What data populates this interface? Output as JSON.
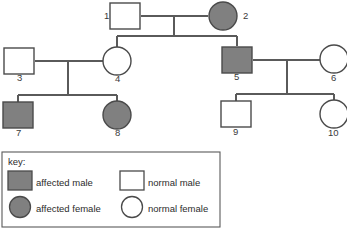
{
  "diagram": {
    "type": "pedigree-chart",
    "colors": {
      "affected_fill": "#808080",
      "normal_fill": "#ffffff",
      "stroke": "#4a4a4a",
      "line": "#5a5a5a",
      "background": "#ffffff"
    },
    "individuals": [
      {
        "id": "1",
        "label": "1",
        "sex": "male",
        "status": "normal",
        "shape": "square",
        "x": 125,
        "y": 16,
        "label_x": 104,
        "label_y": 19,
        "generation": 1
      },
      {
        "id": "2",
        "label": "2",
        "sex": "female",
        "status": "affected",
        "shape": "circle",
        "x": 223,
        "y": 16,
        "label_x": 243,
        "label_y": 19,
        "generation": 1
      },
      {
        "id": "3",
        "label": "3",
        "sex": "male",
        "status": "normal",
        "shape": "square",
        "x": 19,
        "y": 61,
        "label_x": 17,
        "label_y": 81,
        "generation": 2
      },
      {
        "id": "4",
        "label": "4",
        "sex": "female",
        "status": "normal",
        "shape": "circle",
        "x": 117,
        "y": 61,
        "label_x": 115,
        "label_y": 82,
        "generation": 2
      },
      {
        "id": "5",
        "label": "5",
        "sex": "male",
        "status": "affected",
        "shape": "square",
        "x": 237,
        "y": 60,
        "label_x": 234,
        "label_y": 80,
        "generation": 2
      },
      {
        "id": "6",
        "label": "6",
        "sex": "female",
        "status": "normal",
        "shape": "circle",
        "x": 334,
        "y": 59,
        "label_x": 331,
        "label_y": 81,
        "generation": 2
      },
      {
        "id": "7",
        "label": "7",
        "sex": "male",
        "status": "affected",
        "shape": "square",
        "x": 18,
        "y": 115,
        "label_x": 16,
        "label_y": 136,
        "generation": 3
      },
      {
        "id": "8",
        "label": "8",
        "sex": "female",
        "status": "affected",
        "shape": "circle",
        "x": 117,
        "y": 115,
        "label_x": 115,
        "label_y": 136,
        "generation": 3
      },
      {
        "id": "9",
        "label": "9",
        "sex": "male",
        "status": "normal",
        "shape": "square",
        "x": 236,
        "y": 114,
        "label_x": 233,
        "label_y": 135,
        "generation": 3
      },
      {
        "id": "10",
        "label": "10",
        "sex": "female",
        "status": "normal",
        "shape": "circle",
        "x": 334,
        "y": 114,
        "label_x": 328,
        "label_y": 136,
        "generation": 3
      }
    ],
    "matings": [
      {
        "name": "mating-1-2",
        "partners": [
          "1",
          "2"
        ],
        "line_y": 16,
        "x1": 141,
        "x2": 208,
        "drop_x": 174,
        "drop_to_y": 36
      },
      {
        "name": "mating-3-4",
        "partners": [
          "3",
          "4"
        ],
        "line_y": 61,
        "x1": 35,
        "x2": 103,
        "drop_x": 68,
        "drop_to_y": 95
      },
      {
        "name": "mating-5-6",
        "partners": [
          "5",
          "6"
        ],
        "line_y": 60,
        "x1": 253,
        "x2": 320,
        "drop_x": 287,
        "drop_to_y": 94
      }
    ],
    "sibships": [
      {
        "name": "sibship-gen1-children",
        "parents": "1x2",
        "line_y": 36,
        "x1": 117,
        "x2": 237,
        "children": [
          {
            "id": "4",
            "x": 117,
            "to_y": 47
          },
          {
            "id": "5",
            "x": 237,
            "to_y": 46
          }
        ]
      },
      {
        "name": "sibship-gen2-left-children",
        "parents": "3x4",
        "line_y": 95,
        "x1": 18,
        "x2": 117,
        "children": [
          {
            "id": "7",
            "x": 18,
            "to_y": 103
          },
          {
            "id": "8",
            "x": 117,
            "to_y": 101
          }
        ]
      },
      {
        "name": "sibship-gen2-right-children",
        "parents": "5x6",
        "line_y": 94,
        "x1": 236,
        "x2": 334,
        "children": [
          {
            "id": "9",
            "x": 236,
            "to_y": 101
          },
          {
            "id": "10",
            "x": 334,
            "to_y": 101
          }
        ]
      }
    ]
  },
  "key": {
    "title": "key:",
    "box": {
      "x": 2,
      "y": 152,
      "width": 218,
      "height": 75
    },
    "entries": [
      {
        "label": "affected male",
        "shape": "square",
        "status": "affected",
        "swatch_x": 8,
        "swatch_y": 171,
        "text_x": 36,
        "text_y": 186
      },
      {
        "label": "normal male",
        "shape": "square",
        "status": "normal",
        "swatch_x": 120,
        "swatch_y": 171,
        "text_x": 148,
        "text_y": 186
      },
      {
        "label": "affected female",
        "shape": "circle",
        "status": "affected",
        "swatch_x": 8,
        "swatch_y": 197,
        "text_x": 36,
        "text_y": 212
      },
      {
        "label": "normal female",
        "shape": "circle",
        "status": "normal",
        "swatch_x": 120,
        "swatch_y": 197,
        "text_x": 148,
        "text_y": 212
      }
    ]
  }
}
